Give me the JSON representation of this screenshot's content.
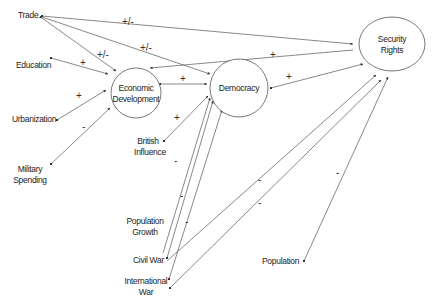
{
  "diagram": {
    "nodes": [
      {
        "id": "economic_development",
        "label_lines": [
          "Economic",
          "Development"
        ],
        "shape": "circle"
      },
      {
        "id": "democracy",
        "label_lines": [
          "Democracy"
        ],
        "shape": "circle"
      },
      {
        "id": "security_rights",
        "label_lines": [
          "Security",
          "Rights"
        ],
        "shape": "ellipse"
      }
    ],
    "variables": [
      {
        "id": "trade",
        "label_lines": [
          "Trade"
        ]
      },
      {
        "id": "education",
        "label_lines": [
          "Education"
        ]
      },
      {
        "id": "urbanization",
        "label_lines": [
          "Urbanization"
        ]
      },
      {
        "id": "military_spending",
        "label_lines": [
          "Military",
          "Spending"
        ]
      },
      {
        "id": "british_influence",
        "label_lines": [
          "British",
          "Influence"
        ]
      },
      {
        "id": "population_growth",
        "label_lines": [
          "Population",
          "Growth"
        ]
      },
      {
        "id": "civil_war",
        "label_lines": [
          "Civil War"
        ]
      },
      {
        "id": "international_war",
        "label_lines": [
          "International",
          "War"
        ]
      },
      {
        "id": "population",
        "label_lines": [
          "Population"
        ]
      }
    ],
    "edges": [
      {
        "from": "trade",
        "to": "security_rights",
        "sign": "+/-"
      },
      {
        "from": "trade",
        "to": "democracy",
        "sign": "+/-"
      },
      {
        "from": "trade",
        "to": "economic_development",
        "sign": "+/-",
        "bidirectional": true
      },
      {
        "from": "education",
        "to": "economic_development",
        "sign": "+"
      },
      {
        "from": "urbanization",
        "to": "economic_development",
        "sign": "+"
      },
      {
        "from": "military_spending",
        "to": "economic_development",
        "sign": "-"
      },
      {
        "from": "economic_development",
        "to": "democracy",
        "sign": "+",
        "bidirectional": true
      },
      {
        "from": "security_rights",
        "to": "economic_development",
        "sign": "+"
      },
      {
        "from": "democracy",
        "to": "security_rights",
        "sign": "+",
        "bidirectional": true
      },
      {
        "from": "british_influence",
        "to": "democracy",
        "sign": "+"
      },
      {
        "from": "population_growth",
        "to": "democracy",
        "sign": "-"
      },
      {
        "from": "civil_war",
        "to": "democracy",
        "sign": "-"
      },
      {
        "from": "international_war",
        "to": "democracy",
        "sign": "-"
      },
      {
        "from": "civil_war",
        "to": "security_rights",
        "sign": "-"
      },
      {
        "from": "international_war",
        "to": "security_rights",
        "sign": "-"
      },
      {
        "from": "population",
        "to": "security_rights",
        "sign": "-"
      }
    ]
  }
}
